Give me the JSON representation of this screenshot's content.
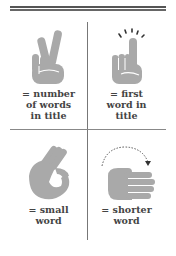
{
  "colors": {
    "hand": "#a9a9a9",
    "text": "#444444",
    "rule": "#555555"
  },
  "cells": [
    {
      "icon": "peace-sign-hand-icon",
      "lines": [
        "= number",
        "of words",
        "in title"
      ]
    },
    {
      "icon": "index-finger-up-hand-icon",
      "lines": [
        "= first",
        "word in",
        "title"
      ]
    },
    {
      "icon": "ok-sign-hand-icon",
      "lines": [
        "= small",
        "word"
      ]
    },
    {
      "icon": "flat-hand-arrow-icon",
      "lines": [
        "= shorter",
        "word"
      ]
    }
  ]
}
